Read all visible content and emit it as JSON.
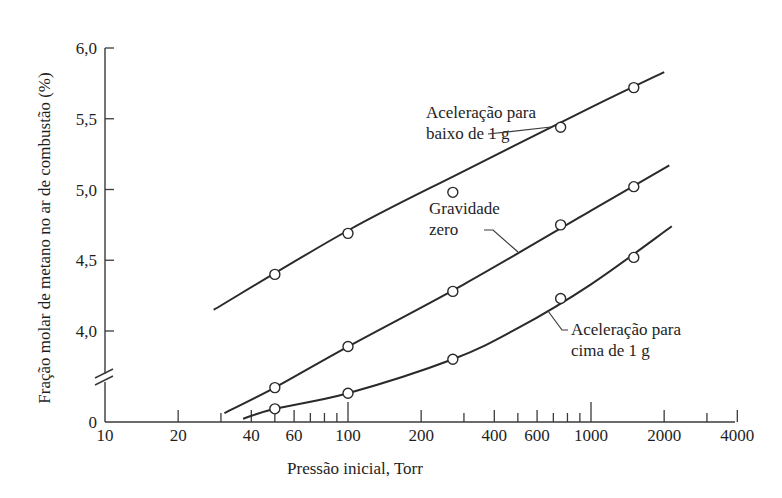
{
  "chart_data": {
    "type": "line",
    "title": "",
    "xlabel": "Pressão inicial, Torr",
    "ylabel": "Fração molar de metano no ar  de combustão (%)",
    "xscale": "log",
    "xlim": [
      10,
      4000
    ],
    "ylim": [
      0,
      6.0
    ],
    "y_axis_break": {
      "between": [
        0,
        4.0
      ],
      "symbol": "//"
    },
    "grid": false,
    "legend": "none (inline annotations)",
    "x_ticks": [
      {
        "value": 10,
        "label": "10",
        "major": true
      },
      {
        "value": 20,
        "label": "20",
        "major": false
      },
      {
        "value": 30,
        "label": "",
        "major": false
      },
      {
        "value": 40,
        "label": "40",
        "major": false
      },
      {
        "value": 50,
        "label": "",
        "major": false
      },
      {
        "value": 60,
        "label": "60",
        "major": false
      },
      {
        "value": 70,
        "label": "",
        "major": false
      },
      {
        "value": 80,
        "label": "",
        "major": false
      },
      {
        "value": 90,
        "label": "",
        "major": false
      },
      {
        "value": 100,
        "label": "100",
        "major": true
      },
      {
        "value": 200,
        "label": "200",
        "major": false
      },
      {
        "value": 300,
        "label": "",
        "major": false
      },
      {
        "value": 400,
        "label": "400",
        "major": false
      },
      {
        "value": 500,
        "label": "",
        "major": false
      },
      {
        "value": 600,
        "label": "600",
        "major": false
      },
      {
        "value": 700,
        "label": "",
        "major": false
      },
      {
        "value": 800,
        "label": "",
        "major": false
      },
      {
        "value": 900,
        "label": "",
        "major": false
      },
      {
        "value": 1000,
        "label": "1000",
        "major": true
      },
      {
        "value": 2000,
        "label": "2000",
        "major": false
      },
      {
        "value": 3000,
        "label": "",
        "major": false
      },
      {
        "value": 4000,
        "label": "4000",
        "major": false
      }
    ],
    "y_ticks": [
      {
        "value": 0,
        "label": "0"
      },
      {
        "value": 4.0,
        "label": "4,0"
      },
      {
        "value": 4.5,
        "label": "4,5"
      },
      {
        "value": 5.0,
        "label": "5,0"
      },
      {
        "value": 5.5,
        "label": "5,5"
      },
      {
        "value": 6.0,
        "label": "6,0"
      }
    ],
    "series": [
      {
        "name": "Aceleração para baixo de 1 g",
        "points": [
          {
            "x": 50,
            "y": 4.4
          },
          {
            "x": 100,
            "y": 4.69
          },
          {
            "x": 270,
            "y": 4.98
          },
          {
            "x": 750,
            "y": 5.44
          },
          {
            "x": 1500,
            "y": 5.72
          }
        ],
        "curve": [
          {
            "x": 28,
            "y": 4.15
          },
          {
            "x": 100,
            "y": 4.71
          },
          {
            "x": 300,
            "y": 5.13
          },
          {
            "x": 1000,
            "y": 5.58
          },
          {
            "x": 2000,
            "y": 5.83
          }
        ]
      },
      {
        "name": "Gravidade zero",
        "points": [
          {
            "x": 50,
            "y": 3.6
          },
          {
            "x": 100,
            "y": 3.89
          },
          {
            "x": 270,
            "y": 4.28
          },
          {
            "x": 750,
            "y": 4.75
          },
          {
            "x": 1500,
            "y": 5.02
          }
        ],
        "curve": [
          {
            "x": 31,
            "y": 3.42
          },
          {
            "x": 50,
            "y": 3.6
          },
          {
            "x": 100,
            "y": 3.89
          },
          {
            "x": 300,
            "y": 4.33
          },
          {
            "x": 1000,
            "y": 4.85
          },
          {
            "x": 2100,
            "y": 5.17
          }
        ]
      },
      {
        "name": "Aceleração para cima de 1 g",
        "points": [
          {
            "x": 50,
            "y": 3.45
          },
          {
            "x": 100,
            "y": 3.56
          },
          {
            "x": 270,
            "y": 3.8
          },
          {
            "x": 750,
            "y": 4.23
          },
          {
            "x": 1500,
            "y": 4.52
          }
        ],
        "curve": [
          {
            "x": 37,
            "y": 3.38
          },
          {
            "x": 50,
            "y": 3.45
          },
          {
            "x": 100,
            "y": 3.56
          },
          {
            "x": 270,
            "y": 3.8
          },
          {
            "x": 500,
            "y": 4.02
          },
          {
            "x": 1000,
            "y": 4.33
          },
          {
            "x": 2150,
            "y": 4.74
          }
        ]
      }
    ],
    "annotations": [
      {
        "id": "down",
        "lines": [
          "Aceleração para",
          "baixo de 1 g"
        ],
        "points_to": {
          "x": 700,
          "y": 5.4
        }
      },
      {
        "id": "zero",
        "lines": [
          "Gravidade",
          "zero"
        ],
        "points_to": {
          "x": 420,
          "y": 4.47
        }
      },
      {
        "id": "up",
        "lines": [
          "Aceleração para",
          "cima de 1 g"
        ],
        "points_to": {
          "x": 600,
          "y": 4.1
        }
      }
    ]
  }
}
